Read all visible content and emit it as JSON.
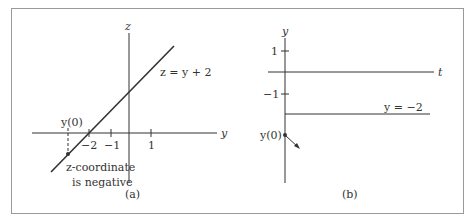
{
  "panel_a": {
    "caption": "(a)",
    "axis_z_label": "z",
    "axis_y_label": "y",
    "line_label": "z = y + 2",
    "ticks": [
      "−2",
      "−1",
      "1"
    ],
    "point_label": "y(0)",
    "note_line1": "z-coordinate",
    "note_line2": "is negative"
  },
  "panel_b": {
    "caption": "(b)",
    "axis_y_label": "y",
    "axis_t_label": "t",
    "ticks": [
      "1",
      "−1"
    ],
    "line_label": "y = −2",
    "point_label": "y(0)"
  },
  "colors": {
    "stroke": "#333333",
    "border": "#999999"
  }
}
